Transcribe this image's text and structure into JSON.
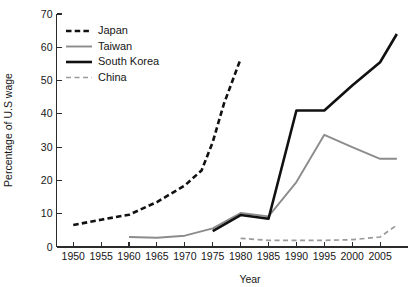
{
  "chart_data": {
    "type": "line",
    "title": "",
    "xlabel": "Year",
    "ylabel": "Percentage of U.S wage",
    "xlim": [
      1947,
      2010
    ],
    "ylim": [
      0,
      70
    ],
    "ytick_labels": [
      "0",
      "10",
      "20",
      "30",
      "40",
      "50",
      "60",
      "70"
    ],
    "yticks": [
      0,
      10,
      20,
      30,
      40,
      50,
      60,
      70
    ],
    "xtick_labels": [
      "1950",
      "1955",
      "1960",
      "1965",
      "1970",
      "1975",
      "1980",
      "1985",
      "1990",
      "1995",
      "2000",
      "2005"
    ],
    "xticks": [
      1950,
      1955,
      1960,
      1965,
      1970,
      1975,
      1980,
      1985,
      1990,
      1995,
      2000,
      2005
    ],
    "grid": false,
    "legend_position": "top-left",
    "series": [
      {
        "name": "Japan",
        "color": "#111111",
        "style": "dashed",
        "width": 2.6,
        "x": [
          1950,
          1955,
          1960,
          1965,
          1970,
          1973,
          1975,
          1977,
          1980
        ],
        "values": [
          6.6,
          8.2,
          9.7,
          13.5,
          18.5,
          23.0,
          31.5,
          43.0,
          56.5
        ]
      },
      {
        "name": "Taiwan",
        "color": "#8c8c8c",
        "style": "solid",
        "width": 1.9,
        "x": [
          1960,
          1965,
          1970,
          1975,
          1980,
          1985,
          1990,
          1995,
          2000,
          2005,
          2008
        ],
        "values": [
          3.0,
          2.8,
          3.4,
          5.6,
          10.2,
          9.2,
          19.5,
          33.7,
          30.0,
          26.5,
          26.5
        ]
      },
      {
        "name": "South Korea",
        "color": "#111111",
        "style": "solid",
        "width": 2.6,
        "x": [
          1975,
          1980,
          1985,
          1990,
          1995,
          2000,
          2005,
          2008
        ],
        "values": [
          4.8,
          9.6,
          8.5,
          41.0,
          41.0,
          48.5,
          55.5,
          64.0
        ]
      },
      {
        "name": "China",
        "color": "#9a9a9a",
        "style": "dashed",
        "width": 1.7,
        "x": [
          1980,
          1985,
          1990,
          1995,
          2000,
          2005,
          2008
        ],
        "values": [
          2.6,
          2.0,
          2.0,
          2.0,
          2.2,
          3.0,
          6.6
        ]
      }
    ]
  },
  "legend": {
    "entries": [
      {
        "label": "Japan"
      },
      {
        "label": "Taiwan"
      },
      {
        "label": "South Korea"
      },
      {
        "label": "China"
      }
    ]
  }
}
